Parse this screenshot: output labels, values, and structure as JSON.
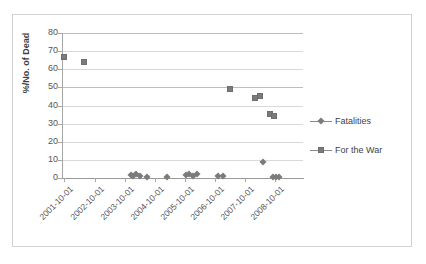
{
  "chart_data": {
    "type": "scatter",
    "title": "",
    "xlabel": "",
    "ylabel": "%/No. of Dead",
    "ylim": [
      0,
      80
    ],
    "y_ticks": [
      "0",
      "10",
      "20",
      "30",
      "40",
      "50",
      "60",
      "70",
      "80"
    ],
    "grid": "horizontal",
    "legend_position": "right",
    "categories": [
      "2001-10-01",
      "2002-10-01",
      "2003-10-01",
      "2004-10-01",
      "2005-10-01",
      "2006-10-01",
      "2007-10-01",
      "2008-10-01"
    ],
    "series": [
      {
        "name": "Fatalities",
        "marker": "diamond",
        "color": "#7b7b7b",
        "points": [
          {
            "x": "2003-12-15",
            "y": 1.5
          },
          {
            "x": "2004-01-10",
            "y": 1.0
          },
          {
            "x": "2004-02-20",
            "y": 2.0
          },
          {
            "x": "2004-04-01",
            "y": 1.0
          },
          {
            "x": "2004-07-01",
            "y": 0.8
          },
          {
            "x": "2005-03-01",
            "y": 0.8
          },
          {
            "x": "2005-10-15",
            "y": 1.5
          },
          {
            "x": "2005-11-20",
            "y": 2.0
          },
          {
            "x": "2006-01-05",
            "y": 1.2
          },
          {
            "x": "2006-03-01",
            "y": 2.0
          },
          {
            "x": "2006-11-01",
            "y": 1.0
          },
          {
            "x": "2007-01-01",
            "y": 1.0
          },
          {
            "x": "2008-05-01",
            "y": 9.0
          },
          {
            "x": "2008-09-01",
            "y": 0.6
          },
          {
            "x": "2008-10-15",
            "y": 0.6
          },
          {
            "x": "2008-11-20",
            "y": 0.6
          }
        ]
      },
      {
        "name": "For the War",
        "marker": "square",
        "color": "#7b7b7b",
        "points": [
          {
            "x": "2001-10-01",
            "y": 67
          },
          {
            "x": "2002-06-01",
            "y": 64
          },
          {
            "x": "2007-04-01",
            "y": 49
          },
          {
            "x": "2008-02-01",
            "y": 44
          },
          {
            "x": "2008-04-01",
            "y": 45.5
          },
          {
            "x": "2008-08-01",
            "y": 35.5
          },
          {
            "x": "2008-09-15",
            "y": 34
          }
        ]
      }
    ]
  },
  "legend": {
    "entries": [
      {
        "label": "Fatalities",
        "marker": "diamond"
      },
      {
        "label": "For the War",
        "marker": "square"
      }
    ]
  },
  "axes": {
    "y_title": "%/No. of Dead"
  }
}
